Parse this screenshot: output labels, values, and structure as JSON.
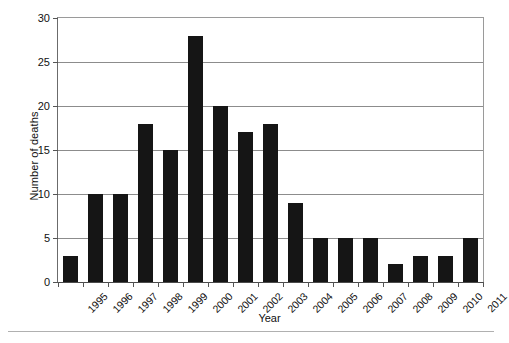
{
  "chart_data": {
    "type": "bar",
    "title": "",
    "xlabel": "Year",
    "ylabel": "Number of deaths",
    "categories": [
      "1995",
      "1996",
      "1997",
      "1998",
      "1999",
      "2000",
      "2001",
      "2002",
      "2003",
      "2004",
      "2005",
      "2006",
      "2007",
      "2008",
      "2009",
      "2010",
      "2011"
    ],
    "values": [
      3,
      10,
      10,
      18,
      15,
      28,
      20,
      17,
      18,
      9,
      5,
      5,
      5,
      2,
      3,
      3,
      5
    ],
    "ylim": [
      0,
      30
    ],
    "yticks": [
      0,
      5,
      10,
      15,
      20,
      25,
      30
    ],
    "ytick_labels": [
      "0",
      "5",
      "10",
      "15",
      "20",
      "25",
      "30"
    ],
    "grid": "horizontal",
    "legend": "none",
    "bar_color": "#151515",
    "grid_color": "#8c8c8c",
    "axis_color": "#4a4a4a",
    "background_color": "#ffffff"
  }
}
